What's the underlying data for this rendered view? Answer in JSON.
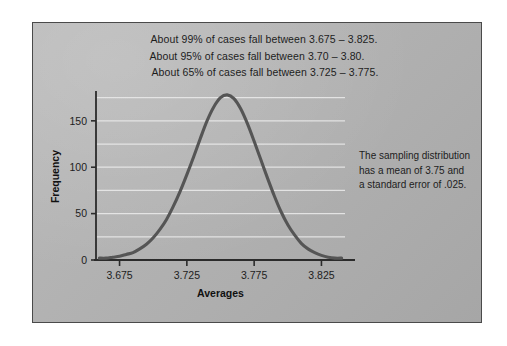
{
  "figure": {
    "annotations": [
      "About 99% of cases fall between 3.675 – 3.825.",
      "About 95% of cases fall between 3.70 – 3.80.",
      "About 65% of cases fall between 3.725 – 3.775."
    ],
    "side_note": [
      "The sampling distribution",
      "has a mean of 3.75 and",
      "a standard error of .025."
    ],
    "colors": {
      "curve": "#555555",
      "gridline": "#e8e8e8",
      "axis": "#2b2b2b",
      "panel_background": "#b2b2b2",
      "text": "#1d1d1d"
    }
  },
  "chart_data": {
    "type": "line",
    "title": "",
    "xlabel": "Averages",
    "ylabel": "Frequency",
    "xlim": [
      3.6575,
      3.8425
    ],
    "ylim": [
      0,
      180
    ],
    "xticks": [
      3.675,
      3.725,
      3.775,
      3.825
    ],
    "xtick_labels": [
      "3.675",
      "3.725",
      "3.775",
      "3.825"
    ],
    "yticks": [
      0,
      50,
      100,
      150
    ],
    "ytick_labels": [
      "0",
      "50",
      "100",
      "150"
    ],
    "gridlines_y": [
      0,
      25,
      50,
      75,
      100,
      125,
      150,
      175
    ],
    "grid": true,
    "legend": "none",
    "distribution": {
      "mean": 3.75,
      "standard_error": 0.025,
      "peak_frequency": 175
    },
    "x": [
      3.66,
      3.665,
      3.67,
      3.675,
      3.68,
      3.685,
      3.69,
      3.695,
      3.7,
      3.705,
      3.71,
      3.715,
      3.72,
      3.725,
      3.73,
      3.735,
      3.74,
      3.745,
      3.75,
      3.755,
      3.76,
      3.765,
      3.77,
      3.775,
      3.78,
      3.785,
      3.79,
      3.795,
      3.8,
      3.805,
      3.81,
      3.815,
      3.82,
      3.825,
      3.83,
      3.835,
      3.84
    ],
    "y": [
      2,
      2,
      3,
      4,
      6,
      8,
      12,
      17,
      24,
      33,
      44,
      58,
      74,
      92,
      111,
      131,
      150,
      165,
      175,
      178,
      174,
      163,
      147,
      128,
      108,
      88,
      69,
      52,
      38,
      27,
      18,
      12,
      8,
      5,
      3,
      2,
      2
    ]
  }
}
